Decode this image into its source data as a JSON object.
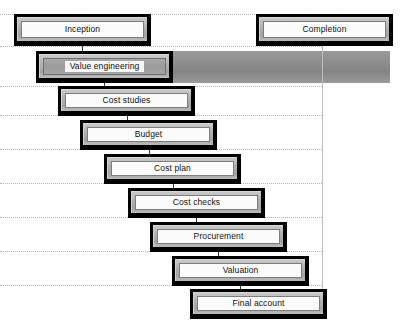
{
  "diagram": {
    "colors": {
      "box_shadow": "#000000",
      "box_bevel": "#b0b0b0",
      "box_face": "#fbfbfb",
      "band": "#8e8e8e",
      "gridline": "#b4b4b4",
      "vertical_line": "#bcbcbc",
      "connector": "#33383c",
      "text": "#111111"
    },
    "nodes": [
      {
        "id": "inception",
        "label": "Inception",
        "x": 14,
        "y": 14,
        "w": 137,
        "h": 32,
        "style": "plain"
      },
      {
        "id": "completion",
        "label": "Completion",
        "x": 256,
        "y": 14,
        "w": 137,
        "h": 32,
        "style": "plain"
      },
      {
        "id": "value-engineering",
        "label": "Value engineering",
        "x": 36,
        "y": 51,
        "w": 137,
        "h": 32,
        "style": "shaded"
      },
      {
        "id": "cost-studies",
        "label": "Cost studies",
        "x": 58,
        "y": 86,
        "w": 137,
        "h": 30,
        "style": "plain"
      },
      {
        "id": "budget",
        "label": "Budget",
        "x": 80,
        "y": 120,
        "w": 137,
        "h": 30,
        "style": "plain"
      },
      {
        "id": "cost-plan",
        "label": "Cost plan",
        "x": 104,
        "y": 154,
        "w": 137,
        "h": 30,
        "style": "plain"
      },
      {
        "id": "cost-checks",
        "label": "Cost checks",
        "x": 128,
        "y": 188,
        "w": 137,
        "h": 30,
        "style": "plain"
      },
      {
        "id": "procurement",
        "label": "Procurement",
        "x": 150,
        "y": 222,
        "w": 137,
        "h": 30,
        "style": "plain"
      },
      {
        "id": "valuation",
        "label": "Valuation",
        "x": 172,
        "y": 256,
        "w": 137,
        "h": 30,
        "style": "plain"
      },
      {
        "id": "final-account",
        "label": "Final account",
        "x": 190,
        "y": 289,
        "w": 137,
        "h": 30,
        "style": "plain"
      }
    ],
    "connectors": [
      {
        "id": "inception-to-value-engineering",
        "x": 82,
        "y": 46,
        "h": 6
      },
      {
        "id": "value-engineering-to-cost-studies",
        "x": 104,
        "y": 81,
        "h": 6
      },
      {
        "id": "cost-studies-to-budget",
        "x": 127,
        "y": 114,
        "h": 7
      },
      {
        "id": "budget-to-cost-plan",
        "x": 149,
        "y": 148,
        "h": 7
      },
      {
        "id": "cost-plan-to-cost-checks",
        "x": 173,
        "y": 182,
        "h": 7
      },
      {
        "id": "cost-checks-to-procurement",
        "x": 196,
        "y": 216,
        "h": 7
      },
      {
        "id": "procurement-to-valuation",
        "x": 218,
        "y": 250,
        "h": 7
      },
      {
        "id": "valuation-to-final-account",
        "x": 240,
        "y": 284,
        "h": 6
      }
    ],
    "gridlines": [
      {
        "id": "grid-row-1",
        "y": 14,
        "w": 393
      },
      {
        "id": "grid-row-2",
        "y": 46,
        "w": 322
      },
      {
        "id": "grid-row-3",
        "y": 86,
        "w": 322
      },
      {
        "id": "grid-row-4",
        "y": 115,
        "w": 322
      },
      {
        "id": "grid-row-5",
        "y": 149,
        "w": 322
      },
      {
        "id": "grid-row-6",
        "y": 183,
        "w": 322
      },
      {
        "id": "grid-row-7",
        "y": 217,
        "w": 322
      },
      {
        "id": "grid-row-8",
        "y": 251,
        "w": 322
      },
      {
        "id": "grid-row-9",
        "y": 285,
        "w": 322
      }
    ],
    "vertical_lines": [
      {
        "id": "right-boundary",
        "x": 322,
        "y": 46,
        "h": 245
      }
    ],
    "band": {
      "id": "value-engineering-band",
      "x": 36,
      "y": 51,
      "w": 354,
      "h": 32
    }
  }
}
